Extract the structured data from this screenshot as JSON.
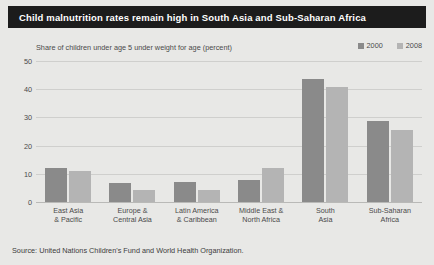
{
  "title": "Child malnutrition rates remain high in South Asia and Sub-Saharan Africa",
  "source": "Source: United Nations Children's Fund and World Health Organization.",
  "colors": {
    "series_2000": "#8a8a8a",
    "series_2008": "#b4b4b4",
    "background": "#e8e8e6",
    "title_bar": "#1c1c1c",
    "gridline": "#cfcfcd"
  },
  "chart_data": {
    "type": "bar",
    "title": "Child malnutrition rates remain high in South Asia and Sub-Saharan Africa",
    "subtitle": "Share of children under age 5 under weight for age (percent)",
    "xlabel": "",
    "ylabel": "",
    "ylim": [
      0,
      50
    ],
    "yticks": [
      0,
      10,
      20,
      30,
      40,
      50
    ],
    "grid": true,
    "legend_position": "top-right",
    "categories": [
      "East Asia\n& Pacific",
      "Europe &\nCentral Asia",
      "Latin America\n& Caribbean",
      "Middle East &\nNorth Africa",
      "South\nAsia",
      "Sub-Saharan\nAfrica"
    ],
    "category_lines": [
      [
        "East Asia",
        "& Pacific"
      ],
      [
        "Europe &",
        "Central Asia"
      ],
      [
        "Latin America",
        "& Caribbean"
      ],
      [
        "Middle East &",
        "North Africa"
      ],
      [
        "South",
        "Asia"
      ],
      [
        "Sub-Saharan",
        "Africa"
      ]
    ],
    "series": [
      {
        "name": "2000",
        "color": "#8a8a8a",
        "values": [
          12.5,
          7.0,
          7.5,
          8.0,
          44.0,
          29.0
        ]
      },
      {
        "name": "2008",
        "color": "#b4b4b4",
        "values": [
          11.5,
          4.5,
          4.5,
          12.5,
          41.0,
          26.0
        ]
      }
    ]
  }
}
